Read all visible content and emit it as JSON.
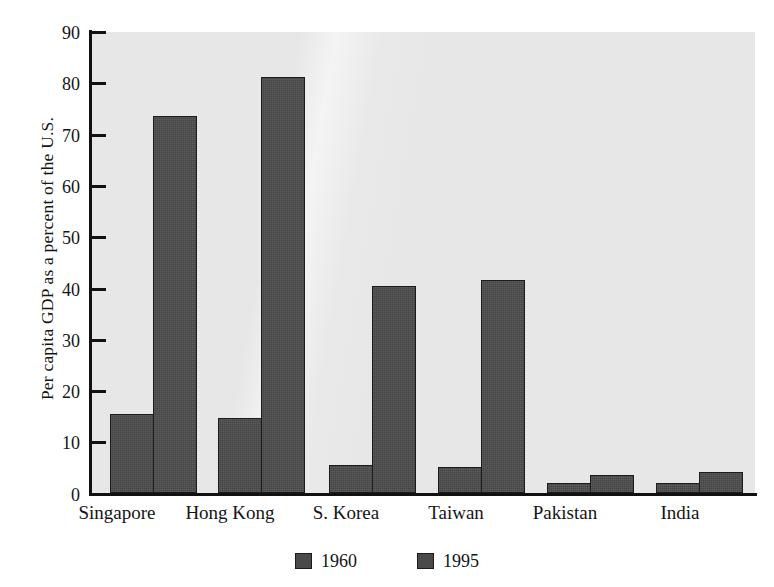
{
  "chart_data": {
    "type": "bar",
    "title": "",
    "xlabel": "",
    "ylabel": "Per capita GDP as a percent of the U.S.",
    "ylim": [
      0,
      90
    ],
    "yticks": [
      0,
      10,
      20,
      30,
      40,
      50,
      60,
      70,
      80,
      90
    ],
    "grid": false,
    "legend_position": "bottom-center",
    "categories": [
      "Singapore",
      "Hong Kong",
      "S. Korea",
      "Taiwan",
      "Pakistan",
      "India"
    ],
    "series": [
      {
        "name": "1960",
        "color": "#4a4a4a",
        "values": [
          15.4,
          14.6,
          5.5,
          5.0,
          2.0,
          1.9
        ]
      },
      {
        "name": "1995",
        "color": "#4a4a4a",
        "values": [
          73.6,
          81.3,
          40.5,
          41.5,
          3.5,
          4.1
        ]
      }
    ]
  },
  "axis": {
    "tick_labels": [
      "90",
      "80",
      "70",
      "60",
      "50",
      "40",
      "30",
      "20",
      "10",
      "0"
    ]
  },
  "legend": {
    "entries": [
      {
        "label": "1960"
      },
      {
        "label": "1995"
      }
    ]
  },
  "style": {
    "plot_background": "#e7e7e7",
    "bar_fill": "#4a4a4a",
    "bar_stroke": "#1b1b1b",
    "axis_color": "#111111",
    "text_color": "#141414"
  }
}
